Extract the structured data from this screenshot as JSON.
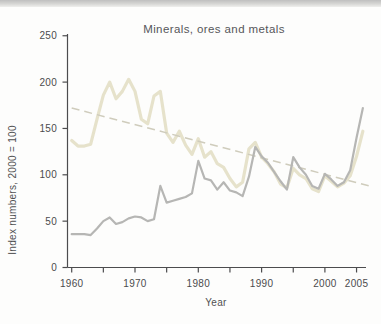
{
  "page": {
    "background": "#fdfdfc",
    "top_strip_color": "#c4c4c4"
  },
  "chart_data": {
    "type": "line",
    "title": "Minerals, ores and metals",
    "xlabel": "Year",
    "ylabel": "Index numbers, 2000 = 100",
    "ylim": [
      0,
      250
    ],
    "xlim": [
      1960,
      2007
    ],
    "yticks": [
      0,
      50,
      100,
      150,
      200,
      250
    ],
    "xticks_major": [
      1960,
      1970,
      1980,
      1990,
      2000,
      2005
    ],
    "xticks_minor": [
      1965,
      1975,
      1985,
      1995
    ],
    "grid": false,
    "legend": "none",
    "axis_color": "#4c4c4e",
    "x": [
      1960,
      1961,
      1962,
      1963,
      1964,
      1965,
      1966,
      1967,
      1968,
      1969,
      1970,
      1971,
      1972,
      1973,
      1974,
      1975,
      1976,
      1977,
      1978,
      1979,
      1980,
      1981,
      1982,
      1983,
      1984,
      1985,
      1986,
      1987,
      1988,
      1989,
      1990,
      1991,
      1992,
      1993,
      1994,
      1995,
      1996,
      1997,
      1998,
      1999,
      2000,
      2001,
      2002,
      2003,
      2004,
      2005,
      2006
    ],
    "series": [
      {
        "name": "tan-line",
        "color": "#e6e2cb",
        "width": 3.2,
        "style": "solid",
        "values": [
          137,
          131,
          131,
          133,
          160,
          186,
          200,
          182,
          190,
          203,
          190,
          160,
          155,
          185,
          190,
          145,
          135,
          147,
          132,
          122,
          139,
          119,
          125,
          112,
          108,
          96,
          87,
          92,
          128,
          135,
          119,
          112,
          103,
          90,
          86,
          107,
          100,
          96,
          85,
          82,
          99,
          93,
          87,
          91,
          99,
          120,
          147
        ]
      },
      {
        "name": "gray-line",
        "color": "#b6b6b4",
        "width": 2.2,
        "style": "solid",
        "values": [
          36,
          36,
          36,
          35,
          42,
          50,
          54,
          47,
          49,
          53,
          55,
          54,
          50,
          52,
          88,
          70,
          72,
          74,
          76,
          80,
          115,
          96,
          94,
          84,
          92,
          83,
          81,
          77,
          98,
          130,
          120,
          113,
          103,
          93,
          84,
          119,
          108,
          100,
          88,
          85,
          101,
          95,
          88,
          92,
          105,
          140,
          172
        ]
      }
    ],
    "trend": {
      "name": "dashed-trend-line",
      "color": "#cfccbc",
      "width": 1.5,
      "style": "dashed",
      "x": [
        1960,
        2007
      ],
      "values": [
        172,
        88
      ]
    }
  }
}
